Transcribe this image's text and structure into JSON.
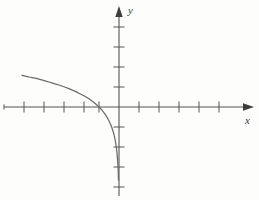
{
  "figure": {
    "background_color": "#fdfdfc",
    "axis_color": "#555555",
    "curve_color": "#6b6b6b",
    "label_color": "#3a3a3a",
    "width": 259,
    "height": 200
  },
  "labels": {
    "x_axis": "x",
    "y_axis": "y"
  },
  "chart_data": {
    "type": "line",
    "title": "",
    "subtitle": "",
    "xlabel": "x",
    "ylabel": "y",
    "grid": false,
    "legend": null,
    "axis_style": "arrows-both-ends",
    "origin_px": [
      119,
      107
    ],
    "unit_px": 20,
    "xlim": [
      -5.75,
      6.2
    ],
    "ylim": [
      -4.6,
      4.9
    ],
    "x_ticks": [
      -5,
      -4,
      -3,
      -2,
      -1,
      1,
      2,
      3,
      4,
      5
    ],
    "y_ticks": [
      -4,
      -3,
      -2,
      -1,
      1,
      2,
      3,
      4
    ],
    "x_tick_labels": [],
    "y_tick_labels": [],
    "annotations": [],
    "series": [
      {
        "name": "curve",
        "equation": "y = -ln(-x)",
        "domain": "x < 0",
        "x_intercept": -1,
        "vertical_asymptote": 0,
        "points": [
          [
            -4.85,
            1.58
          ],
          [
            -4.5,
            1.5
          ],
          [
            -4.0,
            1.39
          ],
          [
            -3.5,
            1.25
          ],
          [
            -3.0,
            1.1
          ],
          [
            -2.5,
            0.92
          ],
          [
            -2.0,
            0.69
          ],
          [
            -1.75,
            0.56
          ],
          [
            -1.5,
            0.41
          ],
          [
            -1.25,
            0.22
          ],
          [
            -1.0,
            0.0
          ],
          [
            -0.85,
            -0.16
          ],
          [
            -0.7,
            -0.36
          ],
          [
            -0.55,
            -0.6
          ],
          [
            -0.45,
            -0.8
          ],
          [
            -0.35,
            -1.05
          ],
          [
            -0.27,
            -1.31
          ],
          [
            -0.2,
            -1.61
          ],
          [
            -0.15,
            -1.9
          ],
          [
            -0.11,
            -2.21
          ],
          [
            -0.08,
            -2.53
          ],
          [
            -0.06,
            -2.81
          ],
          [
            -0.045,
            -3.1
          ],
          [
            -0.034,
            -3.38
          ],
          [
            -0.026,
            -3.65
          ]
        ]
      }
    ]
  }
}
